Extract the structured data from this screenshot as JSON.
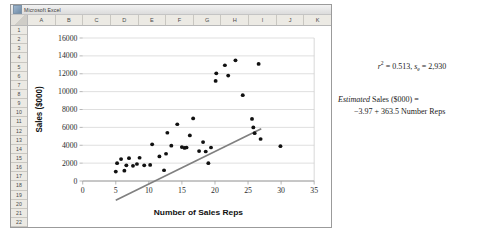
{
  "window": {
    "title": "Microsoft Excel",
    "icon": "excel-icon",
    "columns": [
      "A",
      "B",
      "C",
      "D",
      "E",
      "F",
      "G",
      "H",
      "I",
      "J",
      "K"
    ],
    "rows": [
      "1",
      "2",
      "3",
      "4",
      "5",
      "6",
      "7",
      "8",
      "9",
      "10",
      "11",
      "12",
      "13",
      "14",
      "15",
      "16",
      "17",
      "18",
      "19",
      "20",
      "21",
      "22"
    ]
  },
  "statistics": {
    "r_symbol": "r",
    "r_exponent": "2",
    "r_equals": " = 0.513, ",
    "se_symbol": "s",
    "se_subscript": "e",
    "se_equals": " = 2,930",
    "equation_line1_italic": "Estimated",
    "equation_line1_rest": " Sales ($000) =",
    "equation_line2": "−3.97 + 363.5 Number Reps"
  },
  "chart_data": {
    "type": "scatter",
    "title": "",
    "xlabel": "Number of Sales Reps",
    "ylabel": "Sales ($000)",
    "xlim": [
      0,
      35
    ],
    "ylim": [
      0,
      16000
    ],
    "xticks": [
      0,
      5,
      10,
      15,
      20,
      25,
      30,
      35
    ],
    "yticks": [
      0,
      2000,
      4000,
      6000,
      8000,
      10000,
      12000,
      14000,
      16000
    ],
    "grid": "horizontal",
    "legend": "none",
    "marker_color": "#111111",
    "trendline_color": "#808080",
    "points": [
      [
        5.0,
        1050
      ],
      [
        5.2,
        2000
      ],
      [
        5.8,
        2450
      ],
      [
        6.3,
        1150
      ],
      [
        6.6,
        1750
      ],
      [
        7.0,
        2550
      ],
      [
        7.6,
        1700
      ],
      [
        8.2,
        1900
      ],
      [
        8.6,
        2600
      ],
      [
        9.3,
        1750
      ],
      [
        10.2,
        1800
      ],
      [
        10.5,
        4100
      ],
      [
        11.6,
        2750
      ],
      [
        12.3,
        1200
      ],
      [
        12.6,
        3050
      ],
      [
        12.8,
        5400
      ],
      [
        13.4,
        3950
      ],
      [
        14.3,
        6350
      ],
      [
        15.0,
        3800
      ],
      [
        15.4,
        3700
      ],
      [
        15.7,
        3750
      ],
      [
        16.2,
        5100
      ],
      [
        16.7,
        7000
      ],
      [
        17.6,
        3350
      ],
      [
        18.2,
        4350
      ],
      [
        18.6,
        3300
      ],
      [
        19.0,
        2000
      ],
      [
        19.4,
        3750
      ],
      [
        20.1,
        11200
      ],
      [
        20.2,
        12050
      ],
      [
        21.5,
        12950
      ],
      [
        22.0,
        11800
      ],
      [
        23.1,
        13500
      ],
      [
        24.2,
        9600
      ],
      [
        25.6,
        6950
      ],
      [
        25.8,
        6000
      ],
      [
        26.0,
        5350
      ],
      [
        26.6,
        13100
      ],
      [
        26.9,
        4700
      ],
      [
        29.9,
        3900
      ]
    ],
    "trendline": {
      "intercept": -3970,
      "slope": 363.5,
      "x_start": 5.0,
      "x_end": 27.0,
      "equation": "Estimated Sales ($000) = −3.97 + 363.5 Number Reps",
      "r_squared": 0.513,
      "standard_error": 2930
    }
  }
}
